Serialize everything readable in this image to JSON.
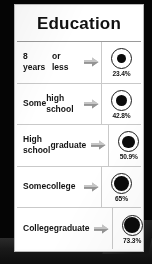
{
  "header": {
    "title": "Education"
  },
  "colors": {
    "card_background": "#ffffff",
    "surround": "#0a0a0a",
    "text": "#141414",
    "dot_fill": "#0b0b0b",
    "ring_stroke": "#1a1a1a",
    "arrow_fill": "#a8a8a8",
    "divider": "#c9c9c9"
  },
  "icons": {
    "arrow": "right-arrow-icon"
  },
  "chart_data": {
    "type": "bar",
    "title": "Education",
    "xlabel": "",
    "ylabel": "",
    "ylim": [
      0,
      100
    ],
    "grid": false,
    "legend": null,
    "categories": [
      "8 years or less",
      "Some high school",
      "High school graduate",
      "Some college",
      "College graduate"
    ],
    "values": [
      23.4,
      42.8,
      50.9,
      65,
      73.3
    ],
    "value_labels": [
      "23.4%",
      "42.8%",
      "50.9%",
      "65%",
      "73.3%"
    ]
  },
  "rows": [
    {
      "label_lines": [
        "8 years",
        "or less"
      ],
      "line1": "8 years",
      "line2": "or less",
      "value": 23.4,
      "value_label": "23.4%"
    },
    {
      "label_lines": [
        "Some",
        "high school"
      ],
      "line1": "Some",
      "line2": "high school",
      "value": 42.8,
      "value_label": "42.8%"
    },
    {
      "label_lines": [
        "High school",
        "graduate"
      ],
      "line1": "High school",
      "line2": "graduate",
      "value": 50.9,
      "value_label": "50.9%"
    },
    {
      "label_lines": [
        "Some",
        "college"
      ],
      "line1": "Some",
      "line2": "college",
      "value": 65,
      "value_label": "65%"
    },
    {
      "label_lines": [
        "College",
        "graduate"
      ],
      "line1": "College",
      "line2": "graduate",
      "value": 73.3,
      "value_label": "73.3%"
    }
  ]
}
